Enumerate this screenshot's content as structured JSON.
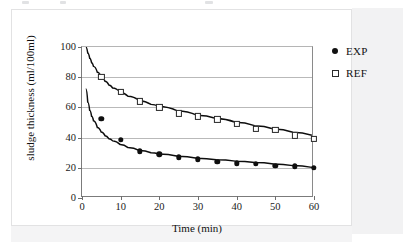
{
  "figure": {
    "legend": [
      {
        "label": "EXP",
        "marker": "filled-circle-icon",
        "color": "#111111"
      },
      {
        "label": "REF",
        "marker": "open-square-icon",
        "color": "#262626"
      }
    ],
    "speck_marks": [
      {
        "x": 22,
        "y": 1,
        "w": 7
      },
      {
        "x": 60,
        "y": 1,
        "w": 6
      },
      {
        "x": 205,
        "y": 1,
        "w": 8
      }
    ]
  },
  "chart_data": {
    "type": "scatter",
    "title": "",
    "subtitle": "",
    "xlabel": "Time (min)",
    "ylabel": "sludge thickness (ml/100ml)",
    "xlim": [
      0,
      60
    ],
    "ylim": [
      0,
      100
    ],
    "xticks": [
      0,
      10,
      20,
      30,
      40,
      50,
      60
    ],
    "yticks": [
      0,
      20,
      40,
      60,
      80,
      100
    ],
    "grid": "horizontal",
    "legend_position": "right-top",
    "x": [
      5,
      10,
      15,
      20,
      25,
      30,
      35,
      40,
      45,
      50,
      55,
      60
    ],
    "series": [
      {
        "name": "EXP",
        "marker": "filled-circle",
        "values": [
          52.5,
          38.5,
          31,
          29,
          27,
          25.5,
          24,
          23,
          22.5,
          21.5,
          21,
          20
        ],
        "fit_curve": {
          "type": "power",
          "points": [
            [
              1,
              72
            ],
            [
              1.5,
              63
            ],
            [
              2,
              57.5
            ],
            [
              2.5,
              53.5
            ],
            [
              3,
              50.5
            ],
            [
              4,
              46
            ],
            [
              5,
              43
            ],
            [
              6,
              40.5
            ],
            [
              7,
              38.5
            ],
            [
              8,
              37
            ],
            [
              10,
              34.5
            ],
            [
              12,
              32.5
            ],
            [
              15,
              30.5
            ],
            [
              18,
              29
            ],
            [
              20,
              28.2
            ],
            [
              25,
              26.7
            ],
            [
              30,
              25.4
            ],
            [
              35,
              24.3
            ],
            [
              40,
              23.4
            ],
            [
              45,
              22.5
            ],
            [
              50,
              21.5
            ],
            [
              55,
              20.4
            ],
            [
              60,
              19.2
            ]
          ]
        }
      },
      {
        "name": "REF",
        "marker": "open-square",
        "values": [
          80,
          70,
          64,
          60,
          56,
          54,
          52,
          49,
          46,
          45,
          41.5,
          39
        ],
        "fit_curve": {
          "type": "power",
          "points": [
            [
              1,
              100
            ],
            [
              1.5,
              96
            ],
            [
              2,
              92.5
            ],
            [
              2.5,
              89.5
            ],
            [
              3,
              87
            ],
            [
              4,
              83
            ],
            [
              5,
              80
            ],
            [
              6,
              77
            ],
            [
              7,
              74.5
            ],
            [
              8,
              72.5
            ],
            [
              10,
              69.5
            ],
            [
              12,
              67
            ],
            [
              15,
              64
            ],
            [
              18,
              61.5
            ],
            [
              20,
              60
            ],
            [
              25,
              57
            ],
            [
              30,
              54.2
            ],
            [
              35,
              52
            ],
            [
              40,
              49.5
            ],
            [
              45,
              47.2
            ],
            [
              50,
              45
            ],
            [
              55,
              42.8
            ],
            [
              60,
              40.7
            ]
          ]
        }
      }
    ]
  }
}
